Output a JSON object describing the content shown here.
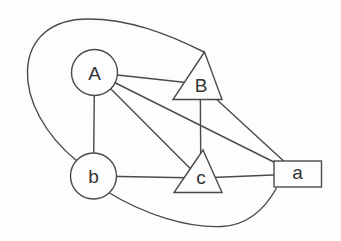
{
  "diagram": {
    "type": "undirected-graph",
    "background_color": "#fdfdfd",
    "line_color": "#4a4a4a",
    "text_color": "#333333",
    "node_fill": "#fdfdfd",
    "nodes": [
      {
        "id": "A",
        "label": "A",
        "shape": "circle"
      },
      {
        "id": "B",
        "label": "B",
        "shape": "triangle"
      },
      {
        "id": "b",
        "label": "b",
        "shape": "circle"
      },
      {
        "id": "c",
        "label": "c",
        "shape": "triangle"
      },
      {
        "id": "a",
        "label": "a",
        "shape": "rectangle"
      }
    ],
    "edges": [
      {
        "from": "A",
        "to": "B",
        "style": "straight"
      },
      {
        "from": "A",
        "to": "b",
        "style": "straight"
      },
      {
        "from": "A",
        "to": "c",
        "style": "straight"
      },
      {
        "from": "A",
        "to": "a",
        "style": "straight"
      },
      {
        "from": "B",
        "to": "c",
        "style": "straight"
      },
      {
        "from": "B",
        "to": "a",
        "style": "straight"
      },
      {
        "from": "b",
        "to": "c",
        "style": "straight"
      },
      {
        "from": "c",
        "to": "a",
        "style": "straight"
      },
      {
        "from": "b",
        "to": "B",
        "style": "curved-around-top-left"
      },
      {
        "from": "b",
        "to": "a",
        "style": "curved-along-bottom"
      }
    ]
  }
}
